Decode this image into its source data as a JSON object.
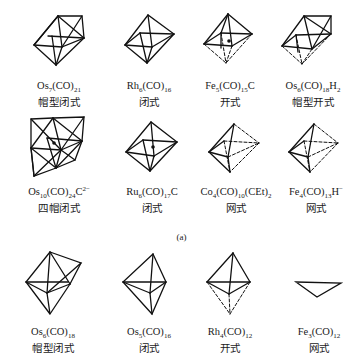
{
  "figure": {
    "caption": "(a)",
    "rows": [
      {
        "items": [
          {
            "formula_html": "Os<sub>7</sub>(CO)<sub>21</sub>",
            "formula": "Os7(CO)21",
            "structure_type": "帽型闭式",
            "shape": "capped-octahedron"
          },
          {
            "formula_html": "Rh<sub>6</sub>(CO)<sub>16</sub>",
            "formula": "Rh6(CO)16",
            "structure_type": "闭式",
            "shape": "octahedron"
          },
          {
            "formula_html": "Fe<sub>5</sub>(CO)<sub>15</sub>C",
            "formula": "Fe5(CO)15C",
            "structure_type": "开式",
            "shape": "square-pyramid-with-carbide"
          },
          {
            "formula_html": "Os<sub>6</sub>(CO)<sub>18</sub>H<sub>2</sub>",
            "formula": "Os6(CO)18H2",
            "structure_type": "帽型开式",
            "shape": "capped-square-pyramid"
          }
        ]
      },
      {
        "items": [
          {
            "formula_html": "Os<sub>10</sub>(CO)<sub>24</sub>C<sup>2−</sup>",
            "formula": "Os10(CO)24C2-",
            "structure_type": "四帽闭式",
            "shape": "tetracapped-octahedron"
          },
          {
            "formula_html": "Ru<sub>6</sub>(CO)<sub>17</sub>C",
            "formula": "Ru6(CO)17C",
            "structure_type": "闭式",
            "shape": "octahedron-with-carbide"
          },
          {
            "formula_html": "Co<sub>4</sub>(CO)<sub>10</sub>(CEt)<sub>2</sub>",
            "formula": "Co4(CO)10(CEt)2",
            "structure_type": "网式",
            "shape": "arachno-octahedron"
          },
          {
            "formula_html": "Fe<sub>4</sub>(CO)<sub>13</sub>H<sup>−</sup>",
            "formula": "Fe4(CO)13H-",
            "structure_type": "网式",
            "shape": "arachno-octahedron"
          }
        ]
      },
      {
        "items": [
          {
            "formula_html": "Os<sub>6</sub>(CO)<sub>18</sub>",
            "formula": "Os6(CO)18",
            "structure_type": "帽型闭式",
            "shape": "capped-trigonal-bipyramid"
          },
          {
            "formula_html": "Os<sub>5</sub>(CO)<sub>16</sub>",
            "formula": "Os5(CO)16",
            "structure_type": "闭式",
            "shape": "trigonal-bipyramid"
          },
          {
            "formula_html": "Rh<sub>4</sub>(CO)<sub>12</sub>",
            "formula": "Rh4(CO)12",
            "structure_type": "开式",
            "shape": "nido-trigonal-bipyramid"
          },
          {
            "formula_html": "Fe<sub>3</sub>(CO)<sub>12</sub>",
            "formula": "Fe3(CO)12",
            "structure_type": "网式",
            "shape": "triangle"
          }
        ]
      }
    ]
  }
}
